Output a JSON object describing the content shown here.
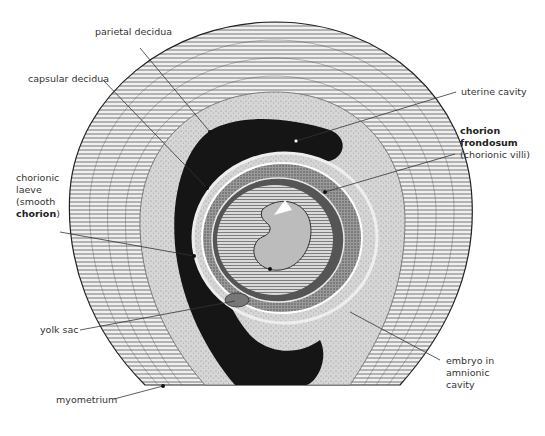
{
  "diagram": {
    "labels": {
      "parietal_decidua": "parietal decidua",
      "capsular_decidua": "capsular decidua",
      "uterine_cavity": "uterine cavity",
      "chorion_frondosum_line1": "chorion",
      "chorion_frondosum_line2": "frondosum",
      "chorion_frondosum_line3": "(chorionic villi)",
      "chorionic_laeve_line1": "chorionic",
      "chorionic_laeve_line2": "laeve",
      "chorionic_laeve_line3": "(smooth",
      "chorionic_laeve_line4_bold": "chorion",
      "chorionic_laeve_line4_tail": ")",
      "yolk_sac": "yolk sac",
      "embryo_line1": "embryo in",
      "embryo_line2": "amnionic",
      "embryo_line3": "cavity",
      "myometrium": "myometrium"
    },
    "colors": {
      "background": "#ffffff",
      "myometrium": "#e9e9e9",
      "myometrium_lines": "#3a3a3a",
      "decidua": "#cfcfcf",
      "cavity": "#151515",
      "chorion": "#8a8a8a",
      "amnion": "#bdbdbd",
      "leader": "#333333",
      "text": "#333333"
    }
  }
}
